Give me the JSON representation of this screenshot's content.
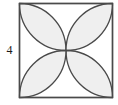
{
  "figure": {
    "kind": "geometry-diagram",
    "side_label": "4",
    "colors": {
      "background": "#ffffff",
      "square_stroke": "#4a4a4a",
      "petal_stroke": "#4a4a4a",
      "petal_fill": "#efefef",
      "label_text": "#1a1a1a"
    },
    "square": {
      "x": 19.5,
      "y": 3.5,
      "width": 93,
      "height": 94,
      "stroke_width": 1.4
    },
    "rosette": {
      "petal_count": 4,
      "arc_radius": 46.5,
      "arc_centers": [
        {
          "name": "top-midpoint",
          "x": 66,
          "y": 3.5
        },
        {
          "name": "right-midpoint",
          "x": 112.5,
          "y": 50.5
        },
        {
          "name": "bottom-midpoint",
          "x": 66,
          "y": 97.5
        },
        {
          "name": "left-midpoint",
          "x": 19.5,
          "y": 50.5
        }
      ],
      "center": {
        "x": 66,
        "y": 50.5
      },
      "petals": [
        {
          "name": "petal-top-left",
          "points_toward": "top-left-corner"
        },
        {
          "name": "petal-top-right",
          "points_toward": "top-right-corner"
        },
        {
          "name": "petal-bottom-right",
          "points_toward": "bottom-right-corner"
        },
        {
          "name": "petal-bottom-left",
          "points_toward": "bottom-left-corner"
        }
      ],
      "stroke_width": 1.3
    }
  }
}
